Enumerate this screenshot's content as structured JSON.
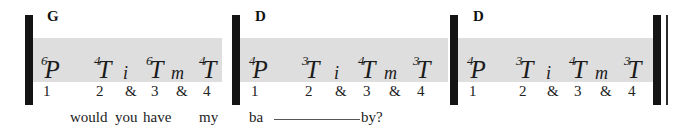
{
  "notation": {
    "type": "guitar-tablature-strum-pattern",
    "chord_label_row": [
      "G",
      "D",
      "D"
    ],
    "measures": [
      {
        "chord": "G",
        "events": [
          {
            "symbol": "P",
            "string": "6",
            "count": "1",
            "lyric": ""
          },
          {
            "symbol": "T",
            "string": "4",
            "count": "2",
            "lyric": "would"
          },
          {
            "symbol": "i",
            "string": "",
            "count": "&",
            "lyric": "you"
          },
          {
            "symbol": "T",
            "string": "6",
            "count": "3",
            "lyric": "have"
          },
          {
            "symbol": "m",
            "string": "",
            "count": "&",
            "lyric": ""
          },
          {
            "symbol": "T",
            "string": "4",
            "count": "4",
            "lyric": "my"
          }
        ]
      },
      {
        "chord": "D",
        "events": [
          {
            "symbol": "P",
            "string": "4",
            "count": "1",
            "lyric": "ba"
          },
          {
            "symbol": "T",
            "string": "3",
            "count": "2",
            "lyric": ""
          },
          {
            "symbol": "i",
            "string": "",
            "count": "&",
            "lyric": ""
          },
          {
            "symbol": "T",
            "string": "4",
            "count": "3",
            "lyric": "by?"
          },
          {
            "symbol": "m",
            "string": "",
            "count": "&",
            "lyric": ""
          },
          {
            "symbol": "T",
            "string": "3",
            "count": "4",
            "lyric": ""
          }
        ]
      },
      {
        "chord": "D",
        "events": [
          {
            "symbol": "P",
            "string": "4",
            "count": "1",
            "lyric": ""
          },
          {
            "symbol": "T",
            "string": "3",
            "count": "2",
            "lyric": ""
          },
          {
            "symbol": "i",
            "string": "",
            "count": "&",
            "lyric": ""
          },
          {
            "symbol": "T",
            "string": "4",
            "count": "3",
            "lyric": ""
          },
          {
            "symbol": "m",
            "string": "",
            "count": "&",
            "lyric": ""
          },
          {
            "symbol": "T",
            "string": "3",
            "count": "4",
            "lyric": ""
          }
        ]
      }
    ],
    "lyrics_line": "would you have my  ba ——— by?",
    "colors": {
      "highlight_band": "#dedede",
      "barline": "#141414",
      "text": "#1a1a1a",
      "page_background": "#ffffff"
    }
  }
}
